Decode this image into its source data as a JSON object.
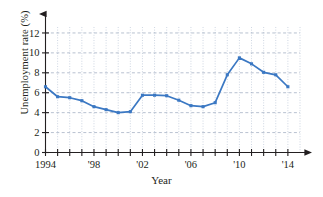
{
  "chart_data": {
    "type": "line",
    "title": "",
    "xlabel": "Year",
    "ylabel": "Unemployment rate (%)",
    "xlim": [
      1994,
      2015
    ],
    "ylim": [
      0,
      13
    ],
    "grid": true,
    "legend": "none",
    "series_color": "#3b78c3",
    "marker": "square",
    "x": [
      1994,
      1995,
      1996,
      1997,
      1998,
      1999,
      2000,
      2001,
      2002,
      2003,
      2004,
      2005,
      2006,
      2007,
      2008,
      2009,
      2010,
      2011,
      2012,
      2013,
      2014
    ],
    "values": [
      6.6,
      5.6,
      5.5,
      5.2,
      4.6,
      4.3,
      4.0,
      4.1,
      5.75,
      5.75,
      5.7,
      5.25,
      4.7,
      4.6,
      5.0,
      7.8,
      9.5,
      8.9,
      8.05,
      7.8,
      6.6
    ],
    "y_ticks": [
      0,
      2,
      4,
      6,
      8,
      10,
      12
    ],
    "y_tick_labels": [
      "0",
      "2",
      "4",
      "6",
      "8",
      "10",
      "12"
    ],
    "x_ticks": [
      1994,
      1995,
      1996,
      1997,
      1998,
      1999,
      2000,
      2001,
      2002,
      2003,
      2004,
      2005,
      2006,
      2007,
      2008,
      2009,
      2010,
      2011,
      2012,
      2013,
      2014
    ],
    "x_tick_labels": [
      "1994",
      "",
      "",
      "",
      "'98",
      "",
      "",
      "",
      "'02",
      "",
      "",
      "",
      "'06",
      "",
      "",
      "",
      "'10",
      "",
      "",
      "",
      "'14"
    ]
  }
}
